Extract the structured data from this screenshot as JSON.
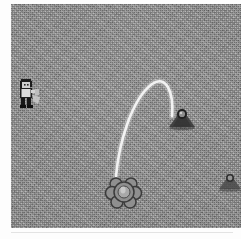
{
  "scene": {
    "title": "Projectile Trajectory Scene",
    "background_color": "#8e8e8e",
    "frame_color": "#fdfdfd",
    "texture": "grainy-dither-noise",
    "width": 241,
    "height": 239
  },
  "playfield": {
    "name": "game-playfield",
    "x": 11,
    "y": 4,
    "width": 230,
    "height": 224
  },
  "trajectory": {
    "name": "projectile-arc",
    "color": "#f2f2f2",
    "stroke_width": 3,
    "start": {
      "x": 116,
      "y": 180
    },
    "peak": {
      "x": 152,
      "y": 80
    },
    "end": {
      "x": 172,
      "y": 116
    },
    "path": "M 105 172 C 108 140, 120 96, 141 80 C 155 70, 163 88, 161 112"
  },
  "entities": [
    {
      "id": "player",
      "name": "player-character-sprite",
      "label": "Player",
      "x": 14,
      "y": 77,
      "width": 30,
      "height": 32,
      "colors": {
        "outline": "#1e1e1e",
        "body": "#d6d6d6",
        "shadow": "#5a5a5a"
      }
    },
    {
      "id": "launcher",
      "name": "cloud-puff-launcher-sprite",
      "label": "Launcher",
      "x": 104,
      "y": 172,
      "width": 40,
      "height": 40,
      "colors": {
        "outline": "#3d3d3d",
        "body": "#9a9a9a",
        "highlight": "#c2c2c2"
      }
    },
    {
      "id": "target-primary",
      "name": "mound-target-sprite",
      "label": "Target",
      "x": 166,
      "y": 105,
      "width": 32,
      "height": 26,
      "colors": {
        "mound": "#3a3a3a",
        "ball": "#222222",
        "rim": "#aaaaaa"
      }
    },
    {
      "id": "target-secondary",
      "name": "secondary-mound-target-sprite",
      "label": "Target 2",
      "x": 216,
      "y": 170,
      "width": 28,
      "height": 22,
      "colors": {
        "mound": "#4a4a4a",
        "ball": "#2e2e2e",
        "rim": "#9e9e9e"
      }
    }
  ]
}
